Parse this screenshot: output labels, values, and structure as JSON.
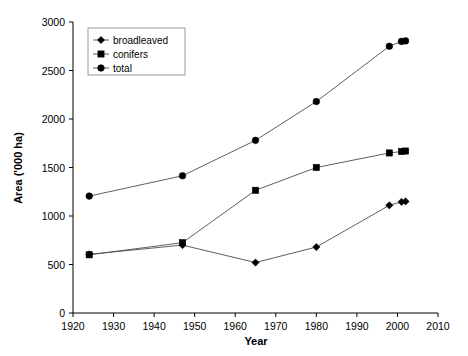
{
  "chart_data": {
    "type": "line",
    "title": "",
    "xlabel": "Year",
    "ylabel": "Area ('000 ha)",
    "xlim": [
      1920,
      2010
    ],
    "ylim": [
      0,
      3000
    ],
    "xticks": [
      1920,
      1930,
      1940,
      1950,
      1960,
      1970,
      1980,
      1990,
      2000,
      2010
    ],
    "yticks": [
      0,
      500,
      1000,
      1500,
      2000,
      2500,
      3000
    ],
    "grid": false,
    "legend_position": "top-left-inside",
    "series": [
      {
        "name": "broadleaved",
        "marker": "diamond",
        "x": [
          1924,
          1947,
          1965,
          1980,
          1998,
          2001,
          2002
        ],
        "values": [
          605,
          700,
          520,
          680,
          1110,
          1145,
          1150
        ]
      },
      {
        "name": "conifers",
        "marker": "square",
        "x": [
          1924,
          1947,
          1965,
          1980,
          1998,
          2001,
          2002
        ],
        "values": [
          600,
          725,
          1265,
          1500,
          1650,
          1665,
          1670
        ]
      },
      {
        "name": "total",
        "marker": "circle",
        "x": [
          1924,
          1947,
          1965,
          1980,
          1998,
          2001,
          2002
        ],
        "values": [
          1205,
          1415,
          1780,
          2180,
          2750,
          2800,
          2805
        ]
      }
    ],
    "colors": {
      "line": "#4d4d4d",
      "marker": "#000000",
      "axis": "#000000",
      "background": "#ffffff"
    }
  },
  "axis": {
    "x_title": "Year",
    "y_title": "Area ('000 ha)",
    "x_tick_labels": [
      "1920",
      "1930",
      "1940",
      "1950",
      "1960",
      "1970",
      "1980",
      "1990",
      "2000",
      "2010"
    ],
    "y_tick_labels": [
      "0",
      "500",
      "1000",
      "1500",
      "2000",
      "2500",
      "3000"
    ]
  },
  "legend": {
    "items": [
      {
        "label": "broadleaved",
        "marker": "diamond-marker-icon"
      },
      {
        "label": "conifers",
        "marker": "square-marker-icon"
      },
      {
        "label": "total",
        "marker": "circle-marker-icon"
      }
    ]
  }
}
